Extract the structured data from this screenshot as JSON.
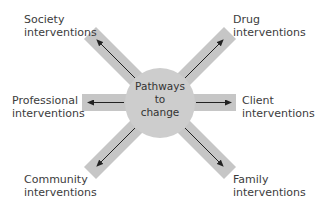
{
  "center": {
    "line1": "Pathways",
    "line2": "to",
    "line3": "change"
  },
  "nodes": [
    {
      "id": "society",
      "line1": "Society",
      "line2": "interventions",
      "position": "top-left"
    },
    {
      "id": "drug",
      "line1": "Drug",
      "line2": "interventions",
      "position": "top-right"
    },
    {
      "id": "professional",
      "line1": "Professional",
      "line2": "interventions",
      "position": "left"
    },
    {
      "id": "client",
      "line1": "Client",
      "line2": "interventions",
      "position": "right"
    },
    {
      "id": "community",
      "line1": "Community",
      "line2": "interventions",
      "position": "bottom-left"
    },
    {
      "id": "family",
      "line1": "Family",
      "line2": "interventions",
      "position": "bottom-right"
    }
  ],
  "colors": {
    "arm_fill": "#c8c8c8",
    "circle_fill": "#cdcdcd",
    "arrow": "#222222"
  }
}
